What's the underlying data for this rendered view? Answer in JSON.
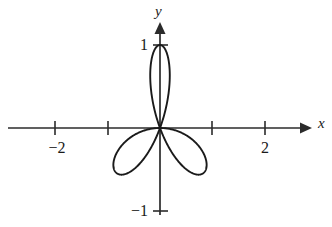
{
  "figure": {
    "title": "",
    "background_color": "#ffffff",
    "line_color": "#1a1a1a",
    "axis_color": "#2b2b2b",
    "width": 332,
    "height": 227
  },
  "axes": {
    "x_label": "x",
    "y_label": "y",
    "origin_px": {
      "x": 160,
      "y": 128
    },
    "x_scale_px_per_unit": 53,
    "y_scale_px_per_unit": 83,
    "x_tick_labels": [
      "−2",
      "2"
    ],
    "y_tick_labels": [
      "1",
      "−1"
    ],
    "x_tick_values": [
      -2,
      -1,
      1,
      2
    ],
    "y_tick_values": [
      1,
      -1
    ],
    "labeled_x_ticks": [
      -2,
      2
    ],
    "labeled_y_ticks": [
      1,
      -1
    ]
  },
  "chart_data": {
    "type": "line",
    "title": "",
    "xlabel": "x",
    "ylabel": "y",
    "grid": false,
    "legend": false,
    "plot_kind": "polar-rose",
    "equation": "r = cos(3θ)",
    "petal_count": 3,
    "max_radius": 1,
    "petal_tip_angles_deg": [
      150,
      30,
      270
    ],
    "petal_tips_xy": [
      {
        "x": -0.87,
        "y": 0.5
      },
      {
        "x": 0.87,
        "y": 0.5
      },
      {
        "x": 0,
        "y": -1
      }
    ],
    "xlim": [
      -3.0,
      3.0
    ],
    "ylim": [
      -1.2,
      1.2
    ],
    "theta_range_deg": [
      0,
      360
    ],
    "x": [
      -0.0,
      -0.037,
      -0.139,
      -0.284,
      -0.442,
      -0.583,
      -0.684,
      -0.731,
      -0.721,
      -0.659,
      -0.556,
      -0.43,
      -0.295,
      -0.167,
      -0.06,
      0.017,
      0.06,
      0.072,
      0.06,
      0.036,
      0.011,
      -0.0,
      0.011,
      0.036,
      0.06,
      0.072,
      0.06,
      0.017,
      -0.06,
      -0.167,
      -0.295,
      -0.43,
      -0.556,
      -0.659,
      -0.721,
      -0.731,
      -0.684,
      -0.583,
      -0.442,
      -0.284,
      -0.139,
      -0.037,
      0.0,
      0.037,
      0.139,
      0.284,
      0.442,
      0.583,
      0.684,
      0.731,
      0.721,
      0.659,
      0.556,
      0.43,
      0.295,
      0.167,
      0.06,
      -0.017,
      -0.06,
      -0.072,
      -0.06,
      -0.036,
      -0.011,
      0.0
    ],
    "y": [
      1.0,
      0.988,
      0.931,
      0.83,
      0.693,
      0.535,
      0.371,
      0.217,
      0.085,
      -0.017,
      -0.085,
      -0.119,
      -0.124,
      -0.106,
      -0.074,
      -0.036,
      -0.0,
      0.026,
      0.036,
      0.029,
      0.009,
      -0.0,
      -0.009,
      -0.029,
      -0.036,
      -0.026,
      0.0,
      0.036,
      0.074,
      0.106,
      0.124,
      0.119,
      0.085,
      0.017,
      -0.085,
      -0.217,
      -0.371,
      -0.535,
      -0.693,
      -0.83,
      -0.931,
      -0.988,
      -1.0,
      -0.988,
      -0.931,
      -0.83,
      -0.693,
      -0.535,
      -0.371,
      -0.217,
      -0.085,
      0.017,
      0.085,
      0.119,
      0.124,
      0.106,
      0.074,
      0.036,
      0.0,
      -0.026,
      -0.036,
      -0.029,
      -0.009,
      0.0
    ]
  }
}
